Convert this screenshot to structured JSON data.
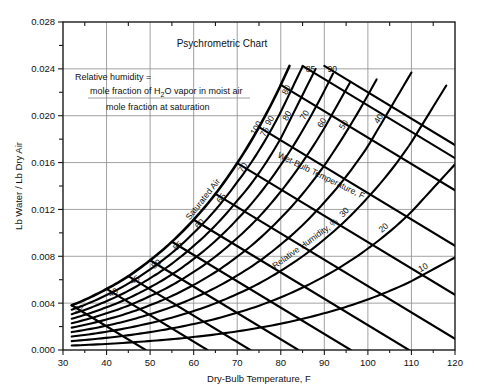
{
  "chart_data": {
    "type": "line",
    "title": "Psychrometric Chart",
    "xlabel": "Dry-Bulb Temperature, F",
    "ylabel": "Lb Water / Lb Dry Air",
    "xlim": [
      30,
      120
    ],
    "ylim": [
      0,
      0.028
    ],
    "grid": true,
    "x_ticks": [
      30,
      40,
      50,
      60,
      70,
      80,
      90,
      100,
      110,
      120
    ],
    "x_tick_labels": [
      "30",
      "40",
      "50",
      "60",
      "70",
      "80",
      "90",
      "100",
      "110",
      "120"
    ],
    "x_minor_ticks": [
      35,
      45,
      55,
      65,
      75,
      85,
      95,
      105,
      115
    ],
    "y_ticks": [
      0.0,
      0.004,
      0.008,
      0.012,
      0.016,
      0.02,
      0.024,
      0.028
    ],
    "y_tick_labels": [
      "0.000",
      "0.004",
      "0.008",
      "0.012",
      "0.016",
      "0.020",
      "0.024",
      "0.028"
    ],
    "y_minor_ticks": [
      0.002,
      0.006,
      0.01,
      0.014,
      0.018,
      0.022,
      0.026
    ],
    "annotation": {
      "line1": "Relative humidity =",
      "line2_num": "mole fraction of H",
      "line2_sub": "2",
      "line2_num2": "O vapor in moist air",
      "line3_den": "mole fraction at saturation"
    },
    "saturation_label": "Saturated Air",
    "wet_bulb_axis_label": "Wet-Bulb Temperature, F",
    "relative_humidity_axis_label": "Relative Humidity, %",
    "relative_humidity_curves": [
      {
        "label": "100",
        "percent": 100
      },
      {
        "label": "90",
        "percent": 90
      },
      {
        "label": "80",
        "percent": 80
      },
      {
        "label": "70",
        "percent": 70
      },
      {
        "label": "60",
        "percent": 60
      },
      {
        "label": "50",
        "percent": 50
      },
      {
        "label": "40",
        "percent": 40
      },
      {
        "label": "30",
        "percent": 30
      },
      {
        "label": "20",
        "percent": 20
      },
      {
        "label": "10",
        "percent": 10
      }
    ],
    "wet_bulb_lines": [
      {
        "label": "32",
        "value": 32
      },
      {
        "label": "40",
        "value": 40
      },
      {
        "label": "45",
        "value": 45
      },
      {
        "label": "50",
        "value": 50
      },
      {
        "label": "55",
        "value": 55
      },
      {
        "label": "60",
        "value": 60
      },
      {
        "label": "65",
        "value": 65
      },
      {
        "label": "70",
        "value": 70
      },
      {
        "label": "75",
        "value": 75
      },
      {
        "label": "80",
        "value": 80
      },
      {
        "label": "85",
        "value": 85
      },
      {
        "label": "90",
        "value": 90
      }
    ],
    "series": [
      {
        "name": "Saturation curve (100% RH)",
        "x": [
          32,
          35,
          40,
          45,
          50,
          55,
          60,
          65,
          70,
          75,
          80,
          82
        ],
        "y": [
          0.00382,
          0.00428,
          0.00521,
          0.0063,
          0.00766,
          0.00924,
          0.01112,
          0.01333,
          0.01596,
          0.01902,
          0.02263,
          0.02425
        ]
      },
      {
        "name": "90% RH",
        "x": [
          32,
          40,
          50,
          60,
          70,
          80,
          85
        ],
        "y": [
          0.00344,
          0.00469,
          0.00689,
          0.01,
          0.01434,
          0.02032,
          0.0242
        ]
      },
      {
        "name": "80% RH",
        "x": [
          32,
          40,
          50,
          60,
          70,
          80,
          88
        ],
        "y": [
          0.00306,
          0.00417,
          0.00613,
          0.00889,
          0.01275,
          0.01806,
          0.024
        ]
      },
      {
        "name": "70% RH",
        "x": [
          32,
          40,
          50,
          60,
          70,
          80,
          90,
          92
        ],
        "y": [
          0.00267,
          0.00365,
          0.00536,
          0.00778,
          0.01116,
          0.0158,
          0.02212,
          0.0236
        ]
      },
      {
        "name": "60% RH",
        "x": [
          32,
          40,
          50,
          60,
          70,
          80,
          90,
          96
        ],
        "y": [
          0.00229,
          0.00313,
          0.0046,
          0.00667,
          0.00956,
          0.01353,
          0.01894,
          0.0229
        ]
      },
      {
        "name": "50% RH",
        "x": [
          32,
          40,
          50,
          60,
          70,
          80,
          90,
          100,
          102
        ],
        "y": [
          0.00191,
          0.00261,
          0.00383,
          0.00556,
          0.00797,
          0.01127,
          0.01576,
          0.02175,
          0.0231
        ]
      },
      {
        "name": "40% RH",
        "x": [
          32,
          40,
          50,
          60,
          70,
          80,
          90,
          100,
          110
        ],
        "y": [
          0.00153,
          0.00208,
          0.00306,
          0.00444,
          0.00637,
          0.00901,
          0.01261,
          0.01739,
          0.02369
        ]
      },
      {
        "name": "30% RH",
        "x": [
          32,
          40,
          50,
          60,
          70,
          80,
          90,
          100,
          110,
          118
        ],
        "y": [
          0.00115,
          0.00156,
          0.0023,
          0.00333,
          0.00478,
          0.00676,
          0.00945,
          0.01303,
          0.01774,
          0.02258
        ]
      },
      {
        "name": "20% RH",
        "x": [
          32,
          40,
          50,
          60,
          70,
          80,
          90,
          100,
          110,
          120
        ],
        "y": [
          0.00076,
          0.00104,
          0.00153,
          0.00222,
          0.00318,
          0.0045,
          0.00629,
          0.00866,
          0.01179,
          0.01585
        ]
      },
      {
        "name": "10% RH",
        "x": [
          32,
          40,
          50,
          60,
          70,
          80,
          90,
          100,
          110,
          120
        ],
        "y": [
          0.00038,
          0.00052,
          0.00077,
          0.00111,
          0.00159,
          0.00225,
          0.00314,
          0.00432,
          0.00588,
          0.0079
        ]
      }
    ]
  }
}
